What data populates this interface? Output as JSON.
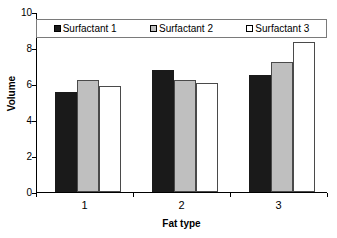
{
  "chart_data": {
    "type": "bar",
    "title": "",
    "xlabel": "Fat type",
    "ylabel": "Volume",
    "categories": [
      "1",
      "2",
      "3"
    ],
    "series": [
      {
        "name": "Surfactant 1",
        "values": [
          5.55,
          6.8,
          6.5
        ],
        "color": "#1a1a1a"
      },
      {
        "name": "Surfactant 2",
        "values": [
          6.2,
          6.2,
          7.2
        ],
        "color": "#bfbfbf"
      },
      {
        "name": "Surfactant 3",
        "values": [
          5.9,
          6.05,
          8.35
        ],
        "color": "#ffffff"
      }
    ],
    "ylim": [
      0,
      10
    ],
    "yticks": [
      0,
      2,
      4,
      6,
      8,
      10
    ],
    "ytick_labels": [
      "0",
      "2",
      "4",
      "6",
      "8",
      "10"
    ],
    "grid": false,
    "legend_position": "top-inside"
  },
  "legend": {
    "entries": [
      {
        "label": "Surfactant 1"
      },
      {
        "label": "Surfactant 2"
      },
      {
        "label": "Surfactant 3"
      }
    ]
  },
  "axes": {
    "y_title": "Volume",
    "x_title": "Fat type"
  }
}
